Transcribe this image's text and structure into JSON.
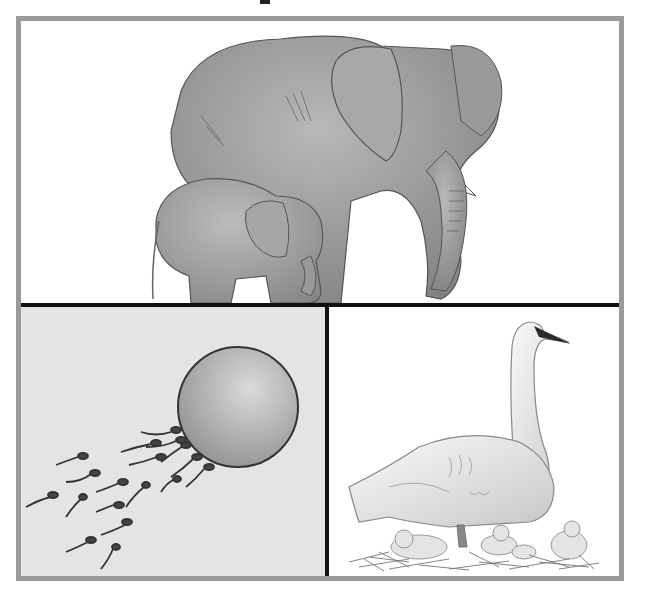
{
  "figure": {
    "panels": [
      {
        "id": "top",
        "subject": "Adult elephant with calf",
        "icon": "elephant-icon"
      },
      {
        "id": "bottom-left",
        "subject": "Sperm cells approaching an egg cell",
        "icon": "egg-and-sperm-icon"
      },
      {
        "id": "bottom-right",
        "subject": "Swan with cygnets in a nest",
        "icon": "swan-icon"
      }
    ],
    "colors": {
      "frame_border": "#9a9a9a",
      "divider": "#111111",
      "bottom_left_bg": "#e4e4e4",
      "swan_beak": "#2a2a2a"
    }
  }
}
